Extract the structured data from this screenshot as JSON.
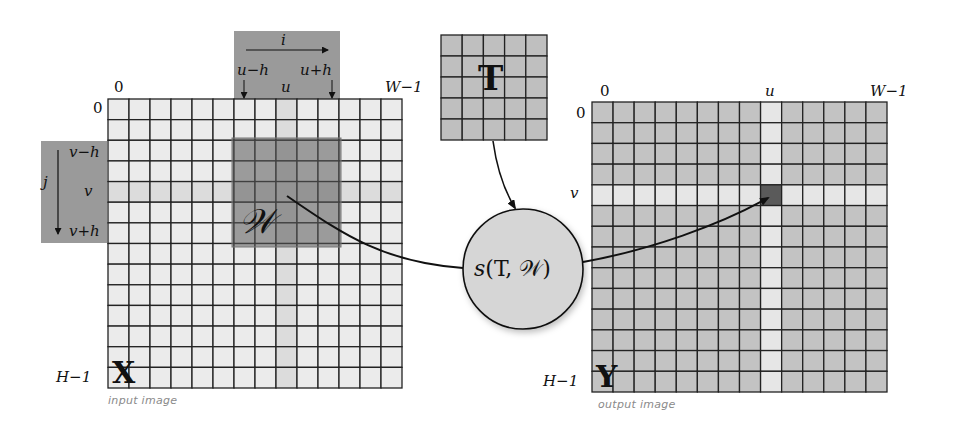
{
  "colors": {
    "input_cell": "#ebebeb",
    "input_highlight": "#dcdcdc",
    "output_cell": "#c3c3c3",
    "output_highlight": "#e6e6e6",
    "output_target": "#5a5a5a",
    "template_cell": "#bfbfbf",
    "window_overlay": "#6e6e6e",
    "index_box": "#9a9a9a",
    "circle_fill": "#d6d6d6",
    "grid_line": "#222222"
  },
  "input_image": {
    "symbol": "X",
    "caption": "input image",
    "cols": 14,
    "rows": 14,
    "x": 108,
    "y": 99,
    "w": 294,
    "h": 289,
    "highlight_col": 8,
    "highlight_row": 4,
    "top_left_col_label": "0",
    "top_right_col_label": "W−1",
    "top_row_label": "0",
    "bottom_row_label": "H−1"
  },
  "index_box_top": {
    "axis_label": "i",
    "left_label": "u−h",
    "center_label": "u",
    "right_label": "u+h"
  },
  "index_box_left": {
    "axis_label": "j",
    "top_label": "v−h",
    "center_label": "v",
    "bottom_label": "v+h"
  },
  "window": {
    "symbol": "𝒲"
  },
  "template": {
    "symbol": "T",
    "cols": 5,
    "rows": 5
  },
  "similarity": {
    "func": "s",
    "args": "(T, 𝒲)",
    "label": "s(T, 𝒲)"
  },
  "output_image": {
    "symbol": "Y",
    "caption": "output image",
    "cols": 14,
    "rows": 14,
    "x": 592,
    "y": 102,
    "w": 295,
    "h": 290,
    "highlight_col": 8,
    "highlight_row": 4,
    "top_left_col_label": "0",
    "col_u_label": "u",
    "top_right_col_label": "W−1",
    "top_row_label": "0",
    "row_v_label": "v",
    "bottom_row_label": "H−1"
  }
}
